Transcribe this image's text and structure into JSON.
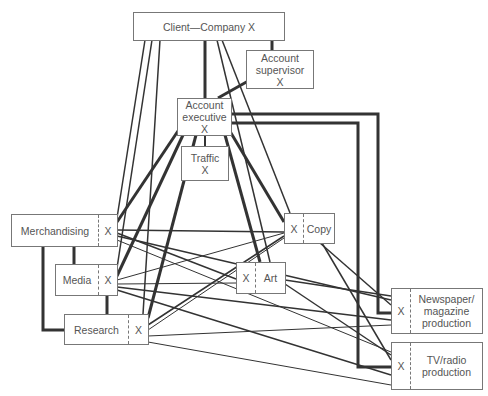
{
  "diagram": {
    "nodes": {
      "client": {
        "label": "Client—Company X"
      },
      "supervisor": {
        "line1": "Account",
        "line2": "supervisor",
        "line3": "X"
      },
      "executive": {
        "line1": "Account",
        "line2": "executive",
        "line3": "X"
      },
      "traffic": {
        "line1": "Traffic",
        "line2": "X"
      },
      "merchandising": {
        "label": "Merchandising",
        "x": "X"
      },
      "media": {
        "label": "Media",
        "x": "X"
      },
      "research": {
        "label": "Research",
        "x": "X"
      },
      "copy": {
        "label": "Copy",
        "x": "X"
      },
      "art": {
        "label": "Art",
        "x": "X"
      },
      "newspaper": {
        "line1": "Newspaper/",
        "line2": "magazine",
        "line3": "production",
        "x": "X"
      },
      "tvradio": {
        "line1": "TV/radio",
        "line2": "production",
        "x": "X"
      }
    },
    "line_color": "#333333"
  }
}
